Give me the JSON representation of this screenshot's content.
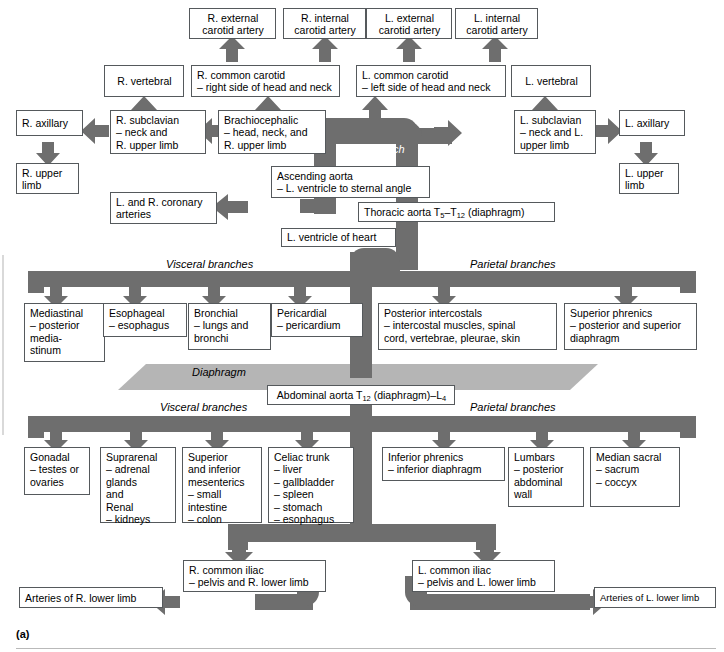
{
  "figure": {
    "label": "(a)",
    "colors": {
      "vessel": "#6e6e6e",
      "diaphragm": "#b5b5b5",
      "box_border": "#55595c",
      "background": "#ffffff"
    }
  },
  "annotations": {
    "aortic_arch": "Aortic arch",
    "diaphragm": "Diaphragm",
    "thoracic_visceral": "Visceral branches",
    "thoracic_parietal": "Parietal branches",
    "abdominal_visceral": "Visceral branches",
    "abdominal_parietal": "Parietal branches"
  },
  "boxes": {
    "r_external_carotid": "R. external\ncarotid artery",
    "r_internal_carotid": "R. internal\ncarotid artery",
    "l_external_carotid": "L. external\ncarotid artery",
    "l_internal_carotid": "L. internal\ncarotid artery",
    "r_vertebral": "R. vertebral",
    "r_common_carotid": "R. common carotid\n– right side of head and neck",
    "l_common_carotid": "L. common carotid\n– left side of head and neck",
    "l_vertebral": "L. vertebral",
    "r_axillary": "R. axillary",
    "r_subclavian": "R. subclavian\n– neck and\n    R. upper limb",
    "brachiocephalic": "Brachiocephalic\n– head, neck, and\n    R. upper limb",
    "l_subclavian": "L. subclavian\n– neck and L.\n  upper limb",
    "l_axillary": "L. axillary",
    "r_upper_limb": "R. upper\nlimb",
    "l_upper_limb": "L. upper\nlimb",
    "ascending_aorta": "Ascending aorta\n– L. ventricle to sternal angle",
    "coronary_arteries": "L. and R. coronary\narteries",
    "l_ventricle": "L. ventricle of heart",
    "thoracic_aorta_pre": "Thoracic aorta T",
    "thoracic_aorta_sub1": "5",
    "thoracic_aorta_mid": "–T",
    "thoracic_aorta_sub2": "12",
    "thoracic_aorta_post": " (diaphragm)",
    "abdominal_aorta_pre": "Abdominal aorta T",
    "abdominal_aorta_sub1": "12",
    "abdominal_aorta_mid": " (diaphragm)–L",
    "abdominal_aorta_sub2": "4",
    "mediastinal": "Mediastinal\n– posterior\n   media-\n   stinum",
    "esophageal": "Esophageal\n– esophagus",
    "bronchial": "Bronchial\n– lungs and\n   bronchi",
    "pericardial": "Pericardial\n– pericardium",
    "posterior_intercostals": "Posterior intercostals\n– intercostal muscles, spinal\n   cord, vertebrae, pleurae, skin",
    "superior_phrenics": "Superior phrenics\n– posterior and superior\n   diaphragm",
    "gonadal": "Gonadal\n– testes or\n   ovaries",
    "suprarenal_renal": "Suprarenal\n– adrenal\n   glands\n   and\nRenal\n– kidneys",
    "mesenterics": "Superior\nand inferior\nmesenterics\n– small\n   intestine\n– colon",
    "celiac_trunk": "Celiac trunk\n– liver\n– gallbladder\n– spleen\n– stomach\n– esophagus",
    "inferior_phrenics": "Inferior phrenics\n– inferior diaphragm",
    "lumbars": "Lumbars\n– posterior\n   abdominal\n   wall",
    "median_sacral": "Median sacral\n– sacrum\n– coccyx",
    "r_common_iliac": "R. common iliac\n– pelvis and R. lower limb",
    "l_common_iliac": "L. common iliac\n– pelvis and L. lower limb",
    "arteries_r_lower_limb": "Arteries of R. lower limb",
    "arteries_l_lower_limb": "Arteries of L. lower limb"
  }
}
